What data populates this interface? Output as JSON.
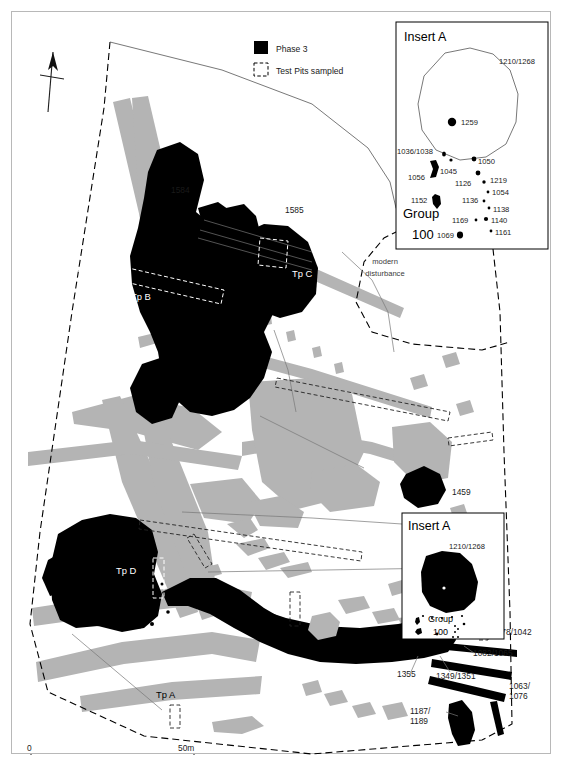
{
  "figure": {
    "type": "archaeological-site-plan",
    "legend": {
      "items": [
        {
          "key": "phase3",
          "label": "Phase 3",
          "swatch": "filled-black-square",
          "color": "#000000"
        },
        {
          "key": "testpits",
          "label": "Test Pits sampled",
          "swatch": "dashed-outline-square",
          "color": "#000000"
        }
      ]
    },
    "north_arrow": {
      "name": "north-arrow",
      "label": ""
    },
    "scale_bar": {
      "start_label": "0",
      "end_label": "50m",
      "length_m": 50
    },
    "annotations": {
      "modern_disturbance": "modern\ndisturbance",
      "modern_disturbance_line1": "modern",
      "modern_disturbance_line2": "disturbance"
    },
    "test_pits": [
      {
        "id": "tpA",
        "label": "Tp A",
        "color": "#000000"
      },
      {
        "id": "tpB",
        "label": "Tp B",
        "color": "#ffffff"
      },
      {
        "id": "tpC",
        "label": "Tp C",
        "color": "#ffffff"
      },
      {
        "id": "tpD",
        "label": "Tp D",
        "color": "#ffffff"
      }
    ],
    "main_feature_labels": [
      {
        "id": "f1584",
        "label": "1584"
      },
      {
        "id": "f1585",
        "label": "1585"
      },
      {
        "id": "f1459",
        "label": "1459"
      },
      {
        "id": "f1355",
        "label": "1355"
      },
      {
        "id": "f1349_1351",
        "label": "1349/1351"
      },
      {
        "id": "f1082_1065",
        "label": "1082/1065"
      },
      {
        "id": "f1078_1042",
        "label": "1078/1042"
      },
      {
        "id": "f1063_1076_a",
        "label": "1063/"
      },
      {
        "id": "f1063_1076_b",
        "label": "1076"
      },
      {
        "id": "f1187_1189_a",
        "label": "1187/"
      },
      {
        "id": "f1187_1189_b",
        "label": "1189"
      }
    ],
    "insert_a_top": {
      "title": "Insert A",
      "group_label_line1": "Group",
      "group_label_line2": "100",
      "enclosure_label": "1210/1268",
      "features": [
        {
          "label": "1259"
        },
        {
          "label": "1036/1038"
        },
        {
          "label": "1045"
        },
        {
          "label": "1050"
        },
        {
          "label": "1056"
        },
        {
          "label": "1126"
        },
        {
          "label": "1219"
        },
        {
          "label": "1054"
        },
        {
          "label": "1152"
        },
        {
          "label": "1136"
        },
        {
          "label": "1138"
        },
        {
          "label": "1169"
        },
        {
          "label": "1140"
        },
        {
          "label": "1069"
        },
        {
          "label": "1161"
        }
      ]
    },
    "insert_a_bottom": {
      "title": "Insert A",
      "enclosure_label": "1210/1268",
      "group_label_line1": "Group",
      "group_label_line2": "100"
    },
    "colors": {
      "phase3_fill": "#000000",
      "background_feature_fill": "#b4b4b4",
      "page_background": "#ffffff",
      "boundary_stroke": "#000000"
    }
  }
}
